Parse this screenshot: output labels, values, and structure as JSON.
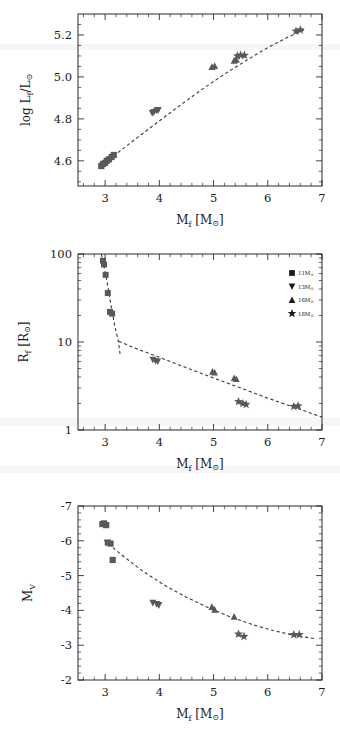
{
  "figure": {
    "marker_color": "#555a5e",
    "line_color": "#3a3a3a",
    "axis_color": "#2b2b2b",
    "background": "#ffffff"
  },
  "legend": {
    "position": "upper-right-panel2",
    "entries": [
      {
        "marker": "square",
        "label": "11M",
        "sub": "⊙"
      },
      {
        "marker": "triangle-down",
        "label": "13M",
        "sub": "⊙"
      },
      {
        "marker": "triangle-up",
        "label": "16M",
        "sub": "⊙"
      },
      {
        "marker": "star",
        "label": "18M",
        "sub": "⊙"
      }
    ]
  },
  "chart_data": [
    {
      "type": "scatter",
      "id": "luminosity",
      "title": "",
      "xlabel": "M_f [M_⊙]",
      "ylabel": "log L_f/L_⊙",
      "xlim": [
        2.5,
        7.0
      ],
      "ylim": [
        4.48,
        5.3
      ],
      "xticks": [
        3,
        4,
        5,
        6,
        7
      ],
      "yticks": [
        4.6,
        4.8,
        5.0,
        5.2
      ],
      "xtick_labels": [
        "3",
        "4",
        "5",
        "6",
        "7"
      ],
      "ytick_labels": [
        "4.6",
        "4.8",
        "5.0",
        "5.2"
      ],
      "grid": false,
      "series": [
        {
          "name": "11M⊙",
          "marker": "square",
          "x": [
            2.93,
            2.96,
            3.0,
            3.03,
            3.07,
            3.12,
            3.16
          ],
          "y": [
            4.575,
            4.585,
            4.59,
            4.6,
            4.607,
            4.618,
            4.628
          ]
        },
        {
          "name": "13M⊙",
          "marker": "triangle-down",
          "x": [
            3.87,
            3.9,
            3.95,
            3.98
          ],
          "y": [
            4.828,
            4.832,
            4.84,
            4.842
          ]
        },
        {
          "name": "16M⊙",
          "marker": "triangle-up",
          "x": [
            4.97,
            5.02,
            5.38,
            5.42
          ],
          "y": [
            5.048,
            5.052,
            5.078,
            5.082
          ]
        },
        {
          "name": "18M⊙",
          "marker": "star",
          "x": [
            5.44,
            5.5,
            5.57,
            6.52,
            6.6
          ],
          "y": [
            5.1,
            5.104,
            5.103,
            5.218,
            5.224
          ]
        }
      ],
      "fit": {
        "style": "dashed",
        "x": [
          2.9,
          3.2,
          3.6,
          4.0,
          4.4,
          4.8,
          5.2,
          5.6,
          6.0,
          6.4,
          6.7
        ],
        "y": [
          4.57,
          4.632,
          4.712,
          4.79,
          4.868,
          4.943,
          5.013,
          5.078,
          5.14,
          5.193,
          5.228
        ]
      }
    },
    {
      "type": "scatter",
      "id": "radius",
      "title": "",
      "xlabel": "M_f [M_⊙]",
      "ylabel": "R_f [R_⊙]",
      "xlim": [
        2.5,
        7.0
      ],
      "ylim": [
        1,
        100
      ],
      "yscale": "log",
      "xticks": [
        3,
        4,
        5,
        6,
        7
      ],
      "yticks": [
        1,
        10,
        100
      ],
      "xtick_labels": [
        "3",
        "4",
        "5",
        "6",
        "7"
      ],
      "ytick_labels": [
        "1",
        "10",
        "100"
      ],
      "grid": false,
      "series": [
        {
          "name": "11M⊙",
          "marker": "square",
          "x": [
            2.96,
            2.98,
            3.01,
            3.05,
            3.09,
            3.13
          ],
          "y": [
            84,
            76,
            58,
            36,
            22,
            21
          ]
        },
        {
          "name": "13M⊙",
          "marker": "triangle-down",
          "x": [
            3.88,
            3.93,
            3.97
          ],
          "y": [
            6.3,
            6.1,
            6.0
          ]
        },
        {
          "name": "16M⊙",
          "marker": "triangle-up",
          "x": [
            4.98,
            5.02,
            5.38,
            5.42
          ],
          "y": [
            4.6,
            4.5,
            3.9,
            3.8
          ]
        },
        {
          "name": "18M⊙",
          "marker": "star",
          "x": [
            5.46,
            5.54,
            5.6,
            6.48,
            6.56
          ],
          "y": [
            2.1,
            2.0,
            1.95,
            1.85,
            1.88
          ]
        }
      ],
      "fit_steep": {
        "style": "dashed",
        "x": [
          2.93,
          3.02,
          3.1,
          3.18,
          3.24,
          3.28
        ],
        "y": [
          100,
          55,
          28,
          15,
          10.5,
          7.0
        ]
      },
      "fit_shallow": {
        "style": "dashed",
        "x": [
          3.25,
          3.6,
          4.0,
          4.5,
          5.0,
          5.5,
          6.0,
          6.5,
          7.0
        ],
        "y": [
          10.2,
          8.3,
          6.7,
          5.1,
          3.9,
          3.0,
          2.3,
          1.8,
          1.4
        ]
      }
    },
    {
      "type": "scatter",
      "id": "magnitude",
      "title": "",
      "xlabel": "M_f [M_⊙]",
      "ylabel": "M_V",
      "xlim": [
        2.5,
        7.0
      ],
      "ylim": [
        -7,
        -2
      ],
      "y_inverted": true,
      "xticks": [
        3,
        4,
        5,
        6,
        7
      ],
      "yticks": [
        -7,
        -6,
        -5,
        -4,
        -3,
        -2
      ],
      "xtick_labels": [
        "3",
        "4",
        "5",
        "6",
        "7"
      ],
      "ytick_labels": [
        "-7",
        "-6",
        "-5",
        "-4",
        "-3",
        "-2"
      ],
      "grid": false,
      "series": [
        {
          "name": "11M⊙",
          "marker": "square",
          "x": [
            2.95,
            2.98,
            3.02,
            3.05,
            3.1,
            3.14
          ],
          "y": [
            -6.48,
            -6.5,
            -6.45,
            -5.95,
            -5.92,
            -5.45
          ]
        },
        {
          "name": "13M⊙",
          "marker": "triangle-down",
          "x": [
            3.88,
            3.95,
            3.99
          ],
          "y": [
            -4.22,
            -4.18,
            -4.15
          ]
        },
        {
          "name": "16M⊙",
          "marker": "triangle-up",
          "x": [
            4.97,
            5.02,
            5.38
          ],
          "y": [
            -4.1,
            -4.02,
            -3.82
          ]
        },
        {
          "name": "18M⊙",
          "marker": "star",
          "x": [
            5.46,
            5.56,
            6.48,
            6.58
          ],
          "y": [
            -3.32,
            -3.25,
            -3.3,
            -3.3
          ]
        }
      ],
      "fit": {
        "style": "dashed",
        "x": [
          2.98,
          3.3,
          3.7,
          4.1,
          4.5,
          4.9,
          5.3,
          5.7,
          6.1,
          6.5,
          6.9
        ],
        "y": [
          -6.02,
          -5.6,
          -5.12,
          -4.72,
          -4.38,
          -4.08,
          -3.82,
          -3.6,
          -3.42,
          -3.28,
          -3.18
        ]
      }
    }
  ]
}
